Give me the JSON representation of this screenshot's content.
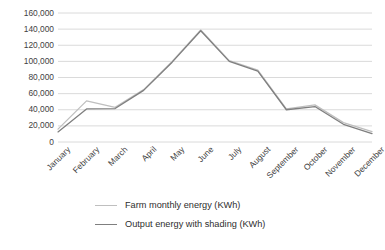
{
  "chart_data": {
    "type": "line",
    "title": "",
    "xlabel": "",
    "ylabel": "",
    "grid": true,
    "legend_position": "bottom",
    "ylim": [
      0,
      160000
    ],
    "ytick_step": 20000,
    "ytick_labels": [
      "160,000",
      "140,000",
      "120,000",
      "100,000",
      "80,000",
      "60,000",
      "40,000",
      "20,000",
      "0"
    ],
    "ytick_values": [
      160000,
      140000,
      120000,
      100000,
      80000,
      60000,
      40000,
      20000,
      0
    ],
    "categories": [
      "January",
      "February",
      "March",
      "April",
      "May",
      "June",
      "July",
      "August",
      "September",
      "October",
      "November",
      "December"
    ],
    "series": [
      {
        "name": "Farm monthly energy (KWh)",
        "color": "#bfbfbf",
        "values": [
          16000,
          51000,
          43000,
          65000,
          100000,
          139000,
          101000,
          89000,
          41000,
          46000,
          24000,
          13000
        ]
      },
      {
        "name": "Output energy with shading (KWh)",
        "color": "#7f7f7f",
        "values": [
          12500,
          41000,
          41500,
          64000,
          99000,
          138000,
          100000,
          88000,
          40000,
          44000,
          22000,
          10500
        ]
      }
    ]
  },
  "legend": {
    "items": [
      {
        "label": "Farm monthly energy (KWh)",
        "color": "#bfbfbf"
      },
      {
        "label": "Output energy with shading (KWh)",
        "color": "#7f7f7f"
      }
    ]
  },
  "colors": {
    "background": "#ffffff",
    "gridline": "#d0d0d0",
    "text": "#3f3f3f",
    "series_farm": "#bfbfbf",
    "series_output": "#7f7f7f"
  }
}
